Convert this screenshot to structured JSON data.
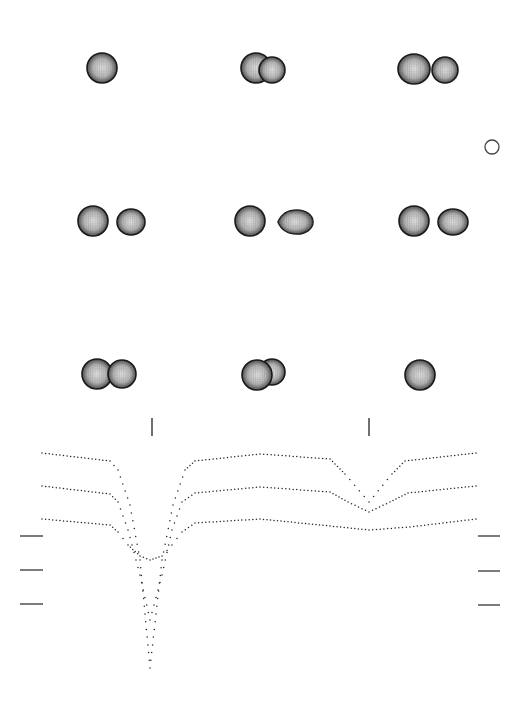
{
  "figure": {
    "colors": {
      "ink": "#222222",
      "star_fill_center": "#d8d8d8",
      "star_fill_edge": "#3a3a3a",
      "background": "#ffffff"
    },
    "scale_marker": {
      "type": "open-circle",
      "cx": 492,
      "cy": 147,
      "r": 7
    },
    "panels": [
      {
        "row": 0,
        "col": 0,
        "cx": 102,
        "cy": 68,
        "stars": [
          {
            "dx": 0,
            "dy": 0,
            "rx": 15,
            "ry": 15
          }
        ]
      },
      {
        "row": 0,
        "col": 1,
        "cx": 262,
        "cy": 68,
        "stars": [
          {
            "dx": -6,
            "dy": 0,
            "rx": 15,
            "ry": 15
          },
          {
            "dx": 10,
            "dy": 2,
            "rx": 13,
            "ry": 13
          }
        ]
      },
      {
        "row": 0,
        "col": 2,
        "cx": 428,
        "cy": 69,
        "stars": [
          {
            "dx": -14,
            "dy": 0,
            "rx": 16,
            "ry": 15
          },
          {
            "dx": 17,
            "dy": 1,
            "rx": 13,
            "ry": 13
          }
        ]
      },
      {
        "row": 1,
        "col": 0,
        "cx": 110,
        "cy": 221,
        "stars": [
          {
            "dx": -17,
            "dy": 0,
            "rx": 15,
            "ry": 15
          },
          {
            "dx": 21,
            "dy": 1,
            "rx": 14,
            "ry": 13
          }
        ]
      },
      {
        "row": 1,
        "col": 1,
        "cx": 272,
        "cy": 221,
        "stars": [
          {
            "dx": -22,
            "dy": 0,
            "rx": 15,
            "ry": 15
          },
          {
            "dx": 25,
            "dy": 1,
            "rx": 16,
            "ry": 12,
            "tear": "left"
          }
        ]
      },
      {
        "row": 1,
        "col": 2,
        "cx": 432,
        "cy": 221,
        "stars": [
          {
            "dx": -18,
            "dy": 0,
            "rx": 15,
            "ry": 15
          },
          {
            "dx": 21,
            "dy": 1,
            "rx": 15,
            "ry": 13
          }
        ]
      },
      {
        "row": 2,
        "col": 0,
        "cx": 108,
        "cy": 374,
        "stars": [
          {
            "dx": -11,
            "dy": 0,
            "rx": 15,
            "ry": 15
          },
          {
            "dx": 14,
            "dy": 0,
            "rx": 14,
            "ry": 14
          }
        ]
      },
      {
        "row": 2,
        "col": 1,
        "cx": 263,
        "cy": 374,
        "stars": [
          {
            "dx": 9,
            "dy": -2,
            "rx": 13,
            "ry": 13
          },
          {
            "dx": -6,
            "dy": 1,
            "rx": 15,
            "ry": 15,
            "front": true
          }
        ]
      },
      {
        "row": 2,
        "col": 2,
        "cx": 420,
        "cy": 375,
        "stars": [
          {
            "dx": 0,
            "dy": 0,
            "rx": 15,
            "ry": 15
          }
        ]
      }
    ],
    "eclipse_markers": [
      {
        "x": 152,
        "y1": 418,
        "y2": 436
      },
      {
        "x": 369,
        "y1": 418,
        "y2": 436
      }
    ],
    "level_ticks_left": [
      {
        "x1": 20,
        "x2": 43,
        "y": 536
      },
      {
        "x1": 20,
        "x2": 43,
        "y": 570
      },
      {
        "x1": 20,
        "x2": 43,
        "y": 604
      }
    ],
    "level_ticks_right": [
      {
        "x1": 478,
        "x2": 500,
        "y": 536
      },
      {
        "x1": 478,
        "x2": 500,
        "y": 571
      },
      {
        "x1": 478,
        "x2": 500,
        "y": 605
      }
    ]
  },
  "chart_data": {
    "type": "scatter",
    "title": "",
    "xlabel": "orbital phase",
    "ylabel": "brightness",
    "grid": false,
    "legend": "none",
    "x_pixel_range": [
      42,
      476
    ],
    "primary_eclipse_x": 152,
    "secondary_eclipse_x": 369,
    "series": [
      {
        "name": "light curve 1 (top)",
        "baseline_y": 453,
        "primary_eclipse_depth_y": 668,
        "secondary_eclipse_depth_y": 502,
        "keypoints": [
          [
            42,
            453
          ],
          [
            110,
            461
          ],
          [
            118,
            470
          ],
          [
            130,
            505
          ],
          [
            140,
            560
          ],
          [
            150,
            668
          ],
          [
            162,
            560
          ],
          [
            173,
            505
          ],
          [
            185,
            470
          ],
          [
            195,
            461
          ],
          [
            260,
            454
          ],
          [
            330,
            459
          ],
          [
            345,
            474
          ],
          [
            369,
            502
          ],
          [
            392,
            474
          ],
          [
            405,
            461
          ],
          [
            476,
            453
          ]
        ]
      },
      {
        "name": "light curve 2 (middle)",
        "baseline_y": 486,
        "primary_eclipse_depth_y": 620,
        "secondary_eclipse_depth_y": 512,
        "keypoints": [
          [
            42,
            486
          ],
          [
            110,
            494
          ],
          [
            118,
            502
          ],
          [
            128,
            530
          ],
          [
            140,
            575
          ],
          [
            150,
            620
          ],
          [
            162,
            575
          ],
          [
            172,
            530
          ],
          [
            182,
            502
          ],
          [
            195,
            493
          ],
          [
            260,
            487
          ],
          [
            330,
            492
          ],
          [
            348,
            502
          ],
          [
            369,
            512
          ],
          [
            390,
            502
          ],
          [
            408,
            493
          ],
          [
            476,
            486
          ]
        ]
      },
      {
        "name": "light curve 3 (bottom)",
        "baseline_y": 519,
        "primary_eclipse_depth_y": 560,
        "secondary_eclipse_depth_y": 530,
        "keypoints": [
          [
            42,
            519
          ],
          [
            110,
            525
          ],
          [
            118,
            532
          ],
          [
            128,
            545
          ],
          [
            140,
            556
          ],
          [
            150,
            560
          ],
          [
            162,
            556
          ],
          [
            172,
            545
          ],
          [
            182,
            532
          ],
          [
            195,
            523
          ],
          [
            260,
            519
          ],
          [
            330,
            526
          ],
          [
            369,
            530
          ],
          [
            410,
            527
          ],
          [
            476,
            519
          ]
        ]
      }
    ]
  }
}
